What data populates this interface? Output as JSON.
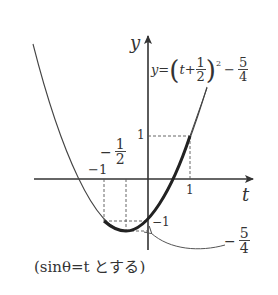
{
  "diagram": {
    "axes": {
      "x_label": "t",
      "y_label": "y"
    },
    "equation": {
      "lhs": "y=",
      "open": "(",
      "var": "t",
      "plus": "+",
      "frac_num": "1",
      "frac_den": "2",
      "close": ")",
      "exp": "2",
      "minus": "−",
      "const_num": "5",
      "const_den": "4"
    },
    "ticks": {
      "x_neg1": "−1",
      "x_neg_half_sign": "−",
      "x_neg_half_num": "1",
      "x_neg_half_den": "2",
      "x_1": "1",
      "y_1": "1",
      "y_neg1": "−1",
      "y_min_sign": "−",
      "y_min_num": "5",
      "y_min_den": "4"
    },
    "caption": "(sinθ=t とする)",
    "colors": {
      "curve": "#444444",
      "axis": "#333333",
      "dashed": "#555555"
    }
  }
}
